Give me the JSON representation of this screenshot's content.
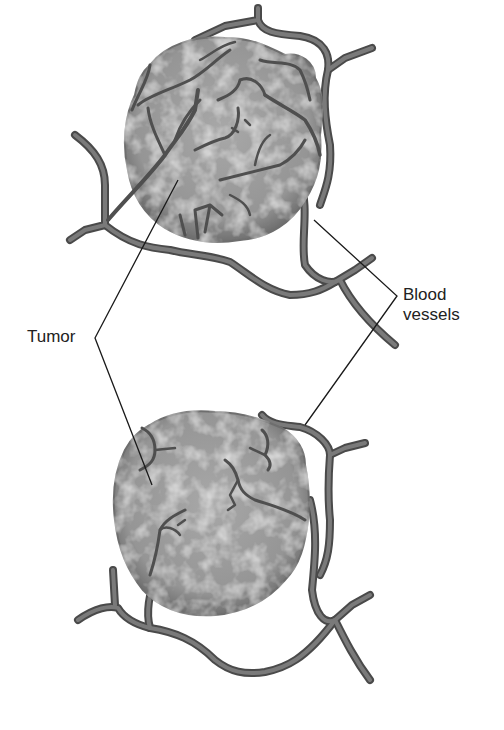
{
  "figure": {
    "type": "illustration",
    "labels": {
      "tumor": "Tumor",
      "blood_vessels_line1": "Blood",
      "blood_vessels_line2": "vessels"
    },
    "panels": [
      {
        "name": "upper-tumor",
        "description": "tumor with many branching blood vessels growing into it"
      },
      {
        "name": "lower-tumor",
        "description": "tumor with few blood vessels"
      }
    ],
    "colors": {
      "tumor_fill": "#9a9a9a",
      "tumor_edge": "#6e6e6e",
      "vessel": "#6a6a6a",
      "vessel_edge": "#4a4a4a",
      "leader_line": "#1a1a1a",
      "text": "#222222"
    }
  }
}
